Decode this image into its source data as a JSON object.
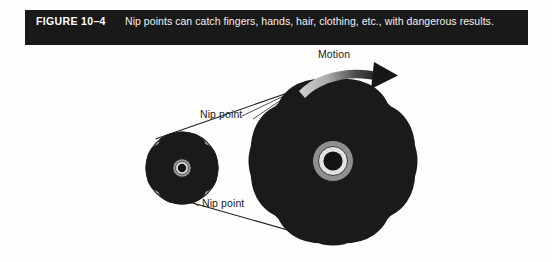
{
  "figure": {
    "number": "FIGURE 10–4",
    "caption": "Nip points can catch fingers, hands, hair, clothing, etc., with dangerous results."
  },
  "labels": {
    "motion": "Motion",
    "nip_point_top": "Nip point",
    "nip_point_bottom": "Nip point"
  },
  "colors": {
    "caption_bar_bg": "#191919",
    "caption_text": "#f2f2f2",
    "pulley_fill": "#b3b3b3",
    "pulley_outline": "#1a1a1a",
    "hub_outer": "#8f8f8f",
    "hub_inner": "#e0e0e0",
    "hub_center": "#141414",
    "cutout_fill": "#ffffff",
    "belt_line": "#1a1a1a",
    "arrow_light": "#c8c8c8",
    "arrow_dark": "#171717",
    "page_bg": "#fefefe"
  },
  "diagram": {
    "type": "mechanical-illustration",
    "small_pulley": {
      "name": "small-pulley",
      "center_x": 182,
      "center_y": 128,
      "outer_radius": 36,
      "inner_radius": 30,
      "hub_radius": 9,
      "spoke_count": 4
    },
    "large_pulley": {
      "name": "large-pulley",
      "center_x": 333,
      "center_y": 121,
      "outer_radius": 79,
      "inner_radius": 67,
      "hub_radius": 20,
      "spoke_count": 4
    },
    "belt": {
      "name": "drive-belt",
      "upper_tangent": [
        [
          156,
          98
        ],
        [
          288,
          52
        ]
      ],
      "lower_tangent": [
        [
          192,
          162
        ],
        [
          322,
          200
        ]
      ]
    },
    "motion_arrow": {
      "direction": "clockwise",
      "position": "above-large-pulley"
    },
    "leaders": [
      {
        "from": [
          248,
          74
        ],
        "to": [
          291,
          55
        ],
        "label": "nip_point_top"
      },
      {
        "from": [
          200,
          163
        ],
        "to": [
          193,
          160
        ],
        "label": "nip_point_bottom"
      }
    ]
  }
}
